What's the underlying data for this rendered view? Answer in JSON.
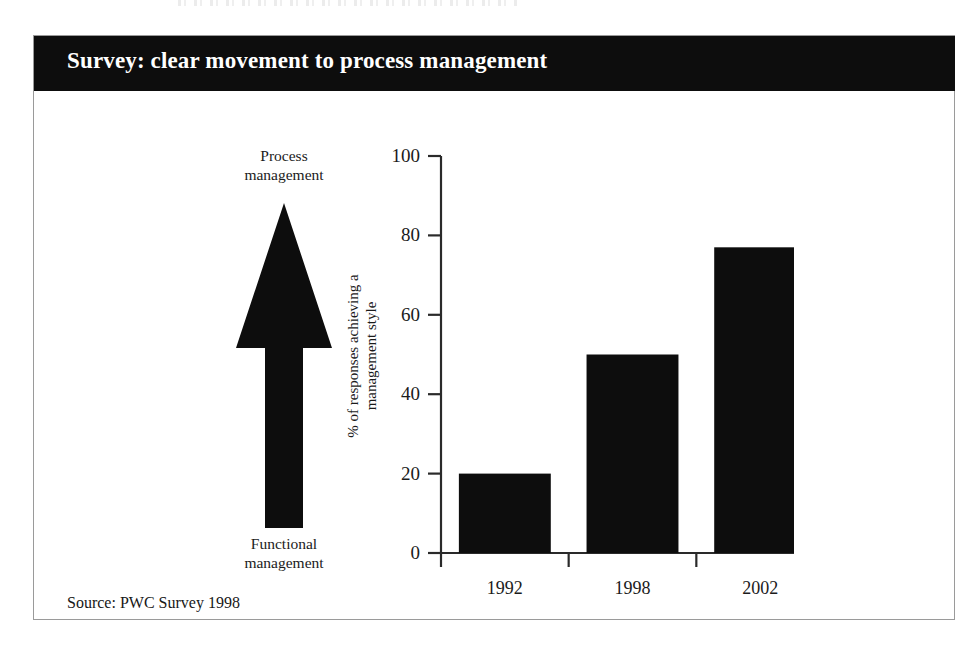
{
  "figure": {
    "title": "Survey: clear movement to process management",
    "source_note": "Source: PWC Survey 1998",
    "colors": {
      "banner_background": "#0d0d0d",
      "banner_text": "#ffffff",
      "bar_fill": "#0d0d0d",
      "axis_line": "#2a2a2a",
      "frame_border": "#9a9a9a",
      "page_background": "#ffffff"
    }
  },
  "arrow_diagram": {
    "icon": "up-arrow-icon",
    "top_label_line1": "Process",
    "top_label_line2": "management",
    "bottom_label_line1": "Functional",
    "bottom_label_line2": "management"
  },
  "chart_data": {
    "type": "bar",
    "title": "Survey: clear movement to process management",
    "categories": [
      "1992",
      "1998",
      "2002"
    ],
    "values": [
      20,
      50,
      77
    ],
    "xlabel": "",
    "ylabel": "% of responses achieving a management style",
    "ylabel_line1": "% of responses achieving a",
    "ylabel_line2": "management style",
    "ylim": [
      0,
      100
    ],
    "yticks": [
      0,
      20,
      40,
      60,
      80,
      100
    ],
    "ytick_labels": [
      "0",
      "20",
      "40",
      "60",
      "80",
      "100"
    ],
    "grid": false,
    "legend": false,
    "series_color": "#0d0d0d",
    "annotation": "Source: PWC Survey 1998"
  }
}
